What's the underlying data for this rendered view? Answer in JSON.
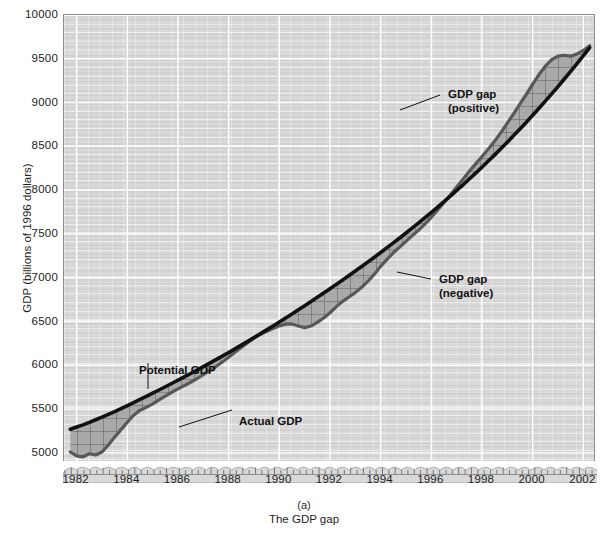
{
  "chart_data": {
    "type": "line",
    "title": "",
    "subtitle": "",
    "panel_id": "(a)",
    "caption": "The GDP gap",
    "xlabel": "",
    "ylabel": "GDP (billions of 1996 dollars)",
    "xlim": [
      1981.5,
      2002.5
    ],
    "ylim": [
      4850,
      10000
    ],
    "ylim_label_min": 5000,
    "grid": true,
    "axis_break": true,
    "legend_position": "inline-annotations",
    "ytick_labels": [
      "5000",
      "5500",
      "6000",
      "6500",
      "7000",
      "7500",
      "8000",
      "8500",
      "9000",
      "9500",
      "10000"
    ],
    "ytick_values": [
      5000,
      5500,
      6000,
      6500,
      7000,
      7500,
      8000,
      8500,
      9000,
      9500,
      10000
    ],
    "xtick_labels": [
      "1982",
      "1984",
      "1986",
      "1988",
      "1990",
      "1992",
      "1994",
      "1996",
      "1998",
      "2000",
      "2002"
    ],
    "xtick_values": [
      1982,
      1984,
      1986,
      1988,
      1990,
      1992,
      1994,
      1996,
      1998,
      2000,
      2002
    ],
    "annotations": [
      {
        "id": "gap-positive",
        "text": "GDP gap\n(positive)"
      },
      {
        "id": "gap-negative",
        "text": "GDP gap\n(negative)"
      },
      {
        "id": "potential-gdp",
        "text": "Potential GDP"
      },
      {
        "id": "actual-gdp",
        "text": "Actual GDP"
      }
    ],
    "colors": {
      "plot_background": "#d9d9d9",
      "gridline": "#ffffff",
      "potential_gdp_line": "#111111",
      "actual_gdp_line": "#585858",
      "gap_fill": "#a9a9a9",
      "frame": "#8d8d8d"
    },
    "x": [
      1981.75,
      1982.0,
      1982.25,
      1982.5,
      1982.75,
      1983.0,
      1983.25,
      1983.5,
      1983.75,
      1984.0,
      1984.25,
      1984.5,
      1984.75,
      1985.0,
      1985.25,
      1985.5,
      1985.75,
      1986.0,
      1986.25,
      1986.5,
      1986.75,
      1987.0,
      1987.25,
      1987.5,
      1987.75,
      1988.0,
      1988.25,
      1988.5,
      1988.75,
      1989.0,
      1989.25,
      1989.5,
      1989.75,
      1990.0,
      1990.25,
      1990.5,
      1990.75,
      1991.0,
      1991.25,
      1991.5,
      1991.75,
      1992.0,
      1992.25,
      1992.5,
      1992.75,
      1993.0,
      1993.25,
      1993.5,
      1993.75,
      1994.0,
      1994.25,
      1994.5,
      1994.75,
      1995.0,
      1995.25,
      1995.5,
      1995.75,
      1996.0,
      1996.25,
      1996.5,
      1996.75,
      1997.0,
      1997.25,
      1997.5,
      1997.75,
      1998.0,
      1998.25,
      1998.5,
      1998.75,
      1999.0,
      1999.25,
      1999.5,
      1999.75,
      2000.0,
      2000.25,
      2000.5,
      2000.75,
      2001.0,
      2001.25,
      2001.5,
      2001.75,
      2002.0,
      2002.25
    ],
    "series": [
      {
        "name": "Potential GDP",
        "color": "#111111",
        "values": [
          5270,
          5295,
          5320,
          5348,
          5378,
          5408,
          5440,
          5472,
          5505,
          5540,
          5575,
          5610,
          5645,
          5682,
          5718,
          5755,
          5792,
          5830,
          5868,
          5906,
          5945,
          5984,
          6024,
          6064,
          6105,
          6146,
          6188,
          6230,
          6273,
          6316,
          6360,
          6404,
          6449,
          6494,
          6540,
          6586,
          6633,
          6680,
          6728,
          6776,
          6825,
          6874,
          6924,
          6974,
          7025,
          7076,
          7128,
          7181,
          7234,
          7288,
          7343,
          7398,
          7454,
          7511,
          7569,
          7627,
          7686,
          7746,
          7807,
          7869,
          7932,
          7996,
          8061,
          8127,
          8194,
          8262,
          8332,
          8403,
          8475,
          8548,
          8623,
          8699,
          8776,
          8855,
          8935,
          9016,
          9099,
          9183,
          9269,
          9356,
          9445,
          9535,
          9627
        ]
      },
      {
        "name": "Actual GDP",
        "color": "#585858",
        "values": [
          5010,
          4965,
          4955,
          4990,
          4975,
          5010,
          5090,
          5180,
          5265,
          5350,
          5430,
          5485,
          5520,
          5560,
          5605,
          5648,
          5690,
          5730,
          5768,
          5806,
          5848,
          5892,
          5938,
          5986,
          6038,
          6092,
          6148,
          6204,
          6258,
          6310,
          6352,
          6388,
          6420,
          6450,
          6470,
          6472,
          6448,
          6430,
          6448,
          6490,
          6540,
          6600,
          6670,
          6730,
          6780,
          6830,
          6890,
          6960,
          7040,
          7130,
          7210,
          7285,
          7350,
          7415,
          7480,
          7545,
          7615,
          7690,
          7775,
          7860,
          7945,
          8035,
          8125,
          8215,
          8300,
          8385,
          8470,
          8560,
          8660,
          8765,
          8875,
          8985,
          9095,
          9210,
          9320,
          9415,
          9490,
          9530,
          9540,
          9530,
          9555,
          9595,
          9650
        ]
      }
    ]
  }
}
